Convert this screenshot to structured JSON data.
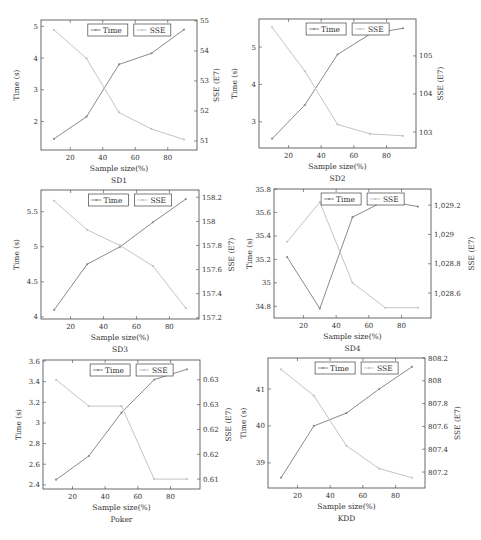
{
  "colors": {
    "time_line": "#8a8a8a",
    "sse_line": "#c4c4c4",
    "frame": "#444444"
  },
  "legend": {
    "time": "Time",
    "sse": "SSE"
  },
  "chart_data": [
    {
      "type": "line",
      "title": "SD1",
      "xlabel": "Sample size(%)",
      "ylabel": "Time (s)",
      "y2label": "SSE (E7)",
      "x": [
        10,
        30,
        50,
        70,
        90
      ],
      "xlim": [
        2,
        98
      ],
      "xticks": [
        20,
        40,
        60,
        80
      ],
      "ylim": [
        1.1,
        5.2
      ],
      "yticks": [
        2,
        3,
        4,
        5
      ],
      "y2lim": [
        50.7,
        55.03
      ],
      "y2ticks": [
        51,
        52,
        53,
        54,
        55
      ],
      "y2ticklabels": [
        "51",
        "52",
        "53",
        "54",
        "55"
      ],
      "series": [
        {
          "name": "Time",
          "axis": "left",
          "values": [
            1.45,
            2.15,
            3.8,
            4.15,
            4.9
          ]
        },
        {
          "name": "SSE",
          "axis": "right",
          "values": [
            54.7,
            53.75,
            51.95,
            51.4,
            51.05
          ]
        }
      ],
      "box": {
        "left": 41,
        "top": 20,
        "right": 197,
        "bottom": 150
      }
    },
    {
      "type": "line",
      "title": "SD2",
      "xlabel": "Sample size(%)",
      "ylabel": "Time (s)",
      "y2label": "SSE (E7)",
      "x": [
        10,
        30,
        50,
        70,
        90
      ],
      "xlim": [
        2,
        98
      ],
      "xticks": [
        20,
        40,
        60,
        80
      ],
      "ylim": [
        2.3,
        5.75
      ],
      "yticks": [
        3,
        4,
        5
      ],
      "y2lim": [
        102.58,
        105.97
      ],
      "y2ticks": [
        103,
        104,
        105
      ],
      "y2ticklabels": [
        "103",
        "104",
        "105"
      ],
      "series": [
        {
          "name": "Time",
          "axis": "left",
          "values": [
            2.55,
            3.45,
            4.8,
            5.35,
            5.5
          ]
        },
        {
          "name": "SSE",
          "axis": "right",
          "values": [
            105.75,
            104.6,
            103.2,
            102.95,
            102.9
          ]
        }
      ],
      "box": {
        "left": 259,
        "top": 19,
        "right": 416,
        "bottom": 148
      }
    },
    {
      "type": "line",
      "title": "SD3",
      "xlabel": "Sample size(%)",
      "ylabel": "Time (s)",
      "y2label": "SSE (E7)",
      "x": [
        10,
        30,
        50,
        70,
        90
      ],
      "xlim": [
        2,
        98
      ],
      "xticks": [
        20,
        40,
        60,
        80
      ],
      "ylim": [
        3.97,
        5.81
      ],
      "yticks": [
        4,
        4.5,
        5,
        5.5
      ],
      "y2lim": [
        157.19,
        158.26
      ],
      "y2ticks": [
        157.2,
        157.4,
        157.6,
        157.8,
        158,
        158.2
      ],
      "y2ticklabels": [
        "157.2",
        "157.4",
        "157.6",
        "157.8",
        "158",
        "158.2"
      ],
      "series": [
        {
          "name": "Time",
          "axis": "left",
          "values": [
            4.1,
            4.75,
            5.0,
            5.35,
            5.68
          ]
        },
        {
          "name": "SSE",
          "axis": "right",
          "values": [
            158.17,
            157.93,
            157.8,
            157.63,
            157.28
          ]
        }
      ],
      "box": {
        "left": 41,
        "top": 190,
        "right": 199,
        "bottom": 319
      }
    },
    {
      "type": "line",
      "title": "SD4",
      "xlabel": "Sample size(%)",
      "ylabel": "Time (s)",
      "y2label": "SSE (E7)",
      "x": [
        10,
        30,
        50,
        70,
        90
      ],
      "xlim": [
        2,
        98
      ],
      "xticks": [
        20,
        40,
        60,
        80
      ],
      "ylim": [
        34.7,
        35.8
      ],
      "yticks": [
        34.8,
        35,
        35.2,
        35.4,
        35.6,
        35.8
      ],
      "y2lim": [
        1028.43,
        1029.31
      ],
      "y2ticks": [
        1028.6,
        1028.8,
        1029,
        1029.2
      ],
      "y2ticklabels": [
        "1,028.6",
        "1,028.8",
        "1,029",
        "1,029.2"
      ],
      "series": [
        {
          "name": "Time",
          "axis": "left",
          "values": [
            35.22,
            34.78,
            35.56,
            35.7,
            35.65
          ]
        },
        {
          "name": "SSE",
          "axis": "right",
          "values": [
            1028.95,
            1029.22,
            1028.67,
            1028.5,
            1028.5
          ]
        }
      ],
      "box": {
        "left": 274,
        "top": 189,
        "right": 431,
        "bottom": 318
      }
    },
    {
      "type": "line",
      "title": "Poker",
      "xlabel": "Sample size(%)",
      "ylabel": "Time (s)",
      "y2label": "SSE (E7)",
      "x": [
        10,
        30,
        50,
        70,
        90
      ],
      "xlim": [
        2,
        98
      ],
      "xticks": [
        20,
        40,
        60,
        80
      ],
      "ylim": [
        2.36,
        3.61
      ],
      "yticks": [
        2.4,
        2.6,
        2.8,
        3,
        3.2,
        3.4,
        3.6
      ],
      "y2lim": [
        0.6055,
        0.6315
      ],
      "y2ticks": [
        0.6075,
        0.6125,
        0.6175,
        0.6225,
        0.6275
      ],
      "y2ticklabels": [
        "0.61",
        "0.62",
        "0.62",
        "0.63",
        "0.63"
      ],
      "series": [
        {
          "name": "Time",
          "axis": "left",
          "values": [
            2.45,
            2.68,
            3.1,
            3.42,
            3.52
          ]
        },
        {
          "name": "SSE",
          "axis": "right",
          "values": [
            0.6275,
            0.6222,
            0.6222,
            0.6075,
            0.6075
          ]
        }
      ],
      "box": {
        "left": 43,
        "top": 360,
        "right": 200,
        "bottom": 489
      }
    },
    {
      "type": "line",
      "title": "KDD",
      "xlabel": "Sample size(%)",
      "ylabel": "Time (s)",
      "y2label": "SSE (E7)",
      "x": [
        10,
        30,
        50,
        70,
        90
      ],
      "xlim": [
        2,
        98
      ],
      "xticks": [
        20,
        40,
        60,
        80
      ],
      "ylim": [
        38.32,
        41.84
      ],
      "yticks": [
        39,
        40,
        41
      ],
      "y2lim": [
        807.06,
        808.2
      ],
      "y2ticks": [
        807.2,
        807.4,
        807.6,
        807.8,
        808,
        808.2
      ],
      "y2ticklabels": [
        "807.2",
        "807.4",
        "807.6",
        "807.8",
        "808",
        "808.2"
      ],
      "series": [
        {
          "name": "Time",
          "axis": "left",
          "values": [
            38.6,
            40.0,
            40.35,
            41.0,
            41.6
          ]
        },
        {
          "name": "SSE",
          "axis": "right",
          "values": [
            808.1,
            807.87,
            807.43,
            807.23,
            807.15
          ]
        }
      ],
      "box": {
        "left": 268,
        "top": 358,
        "right": 425,
        "bottom": 488
      }
    }
  ]
}
